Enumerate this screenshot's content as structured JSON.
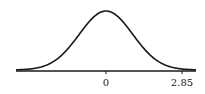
{
  "chart_data": {
    "type": "line",
    "title": "",
    "xlabel": "",
    "ylabel": "",
    "tick_labels": [
      "0",
      "2.85"
    ],
    "tick_values": [
      0,
      2.85
    ],
    "xlim": [
      -3.7,
      3.7
    ],
    "grid": false,
    "legend": null
  },
  "colors": {
    "line": "#1a1a1a",
    "background": "#ffffff"
  }
}
